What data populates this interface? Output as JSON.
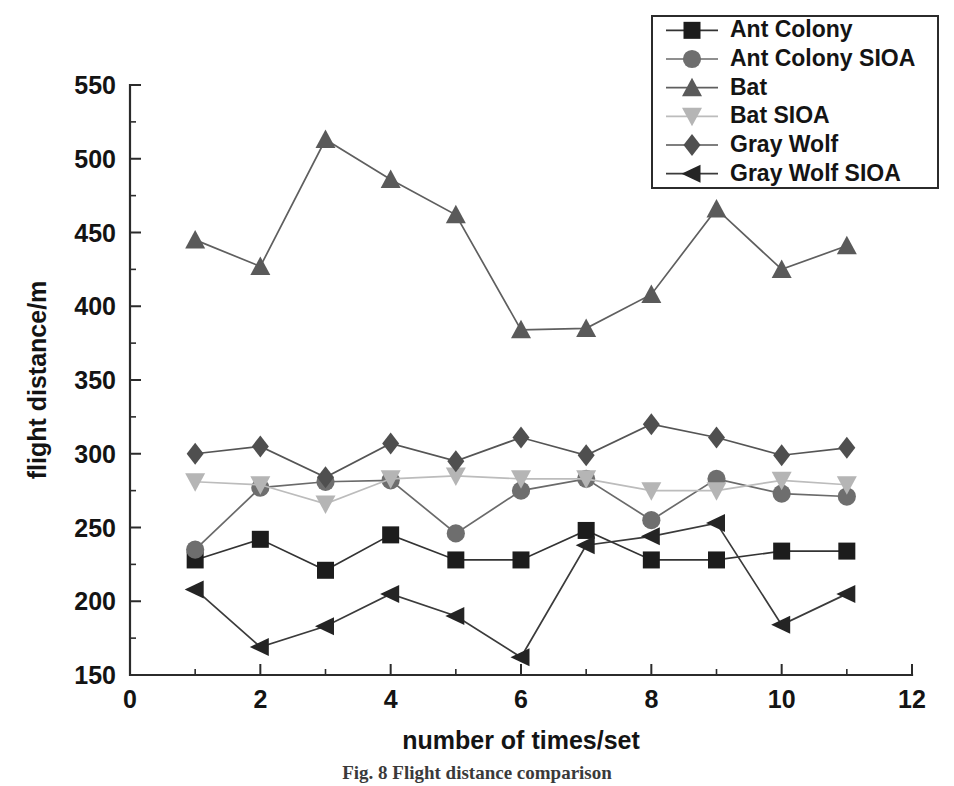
{
  "figure": {
    "caption": "Fig. 8  Flight distance comparison"
  },
  "chart_data": {
    "type": "line",
    "title": "",
    "subtitle": "",
    "xlabel": "number of times/set",
    "ylabel": "flight distance/m",
    "xlim": [
      0,
      12
    ],
    "ylim": [
      150,
      550
    ],
    "xticks": [
      0,
      2,
      4,
      6,
      8,
      10,
      12
    ],
    "xtick_labels": [
      "0",
      "2",
      "4",
      "6",
      "8",
      "10",
      "12"
    ],
    "xminor_ticks": [
      1,
      3,
      5,
      7,
      9,
      11
    ],
    "yticks": [
      150,
      200,
      250,
      300,
      350,
      400,
      450,
      500,
      550
    ],
    "ytick_labels": [
      "150",
      "200",
      "250",
      "300",
      "350",
      "400",
      "450",
      "500",
      "550"
    ],
    "yminor_ticks": [
      175,
      225,
      275,
      325,
      375,
      425,
      475,
      525
    ],
    "grid": false,
    "legend_position": "top-right",
    "x": [
      1,
      2,
      3,
      4,
      5,
      6,
      7,
      8,
      9,
      10,
      11
    ],
    "series": [
      {
        "name": "Ant Colony",
        "marker": "square",
        "color": "#1c1c1c",
        "line_color": "#333333",
        "values": [
          228,
          242,
          221,
          245,
          228,
          228,
          248,
          228,
          228,
          234,
          234
        ]
      },
      {
        "name": "Ant Colony SIOA",
        "marker": "circle",
        "color": "#6e6e6e",
        "line_color": "#6a6a6a",
        "values": [
          235,
          277,
          281,
          282,
          246,
          275,
          283,
          255,
          283,
          273,
          271
        ]
      },
      {
        "name": "Bat",
        "marker": "triangle-up",
        "color": "#5a5a5a",
        "line_color": "#5f5f5f",
        "values": [
          445,
          427,
          513,
          486,
          462,
          384,
          385,
          408,
          466,
          425,
          441
        ]
      },
      {
        "name": "Bat SIOA",
        "marker": "triangle-down",
        "color": "#b5b5b5",
        "line_color": "#bcbcbc",
        "values": [
          281,
          279,
          266,
          283,
          285,
          283,
          283,
          275,
          275,
          282,
          279
        ]
      },
      {
        "name": "Gray Wolf",
        "marker": "diamond",
        "color": "#4f4f4f",
        "line_color": "#555555",
        "values": [
          300,
          305,
          284,
          307,
          295,
          311,
          299,
          320,
          311,
          299,
          304
        ]
      },
      {
        "name": "Gray Wolf SIOA",
        "marker": "triangle-left",
        "color": "#242424",
        "line_color": "#3b3b3b",
        "values": [
          208,
          169,
          183,
          205,
          190,
          162,
          238,
          244,
          253,
          184,
          205
        ]
      }
    ]
  },
  "legend": {
    "entries": [
      "Ant Colony",
      "Ant Colony SIOA",
      "Bat",
      "Bat SIOA",
      "Gray Wolf",
      "Gray Wolf SIOA"
    ]
  }
}
